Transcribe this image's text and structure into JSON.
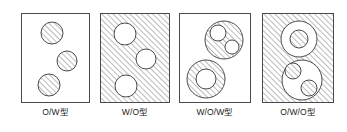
{
  "figure": {
    "title": "",
    "type": "emulsion-type-diagram",
    "colors": {
      "stroke": "#4a4a4a",
      "hatch": "#6b6b6b",
      "background": "#ffffff",
      "label": "#1a1a1a"
    },
    "hatch": {
      "angle_deg": 45,
      "direction": "lower-left-to-upper-right",
      "spacing_px": 4
    }
  },
  "panels": [
    {
      "id": "o-w",
      "label": "O/W型",
      "continuous_phase": "white",
      "box": {
        "x": 21,
        "y": 13,
        "width": 69,
        "height": 90
      },
      "droplets": [
        {
          "cx": 30,
          "cy": 19,
          "r": 11,
          "fill": "hatched",
          "inner": []
        },
        {
          "cx": 45,
          "cy": 47,
          "r": 10,
          "fill": "hatched",
          "inner": []
        },
        {
          "cx": 27,
          "cy": 71,
          "r": 11,
          "fill": "hatched",
          "inner": []
        }
      ]
    },
    {
      "id": "w-o",
      "label": "W/O型",
      "continuous_phase": "hatched",
      "box": {
        "x": 100,
        "y": 13,
        "width": 70,
        "height": 90
      },
      "droplets": [
        {
          "cx": 24,
          "cy": 20,
          "r": 11,
          "fill": "white",
          "inner": []
        },
        {
          "cx": 45,
          "cy": 45,
          "r": 10,
          "fill": "white",
          "inner": []
        },
        {
          "cx": 25,
          "cy": 72,
          "r": 11,
          "fill": "white",
          "inner": []
        }
      ]
    },
    {
      "id": "w-o-w",
      "label": "W/O/W型",
      "continuous_phase": "white",
      "box": {
        "x": 179,
        "y": 13,
        "width": 72,
        "height": 90
      },
      "droplets": [
        {
          "cx": 44,
          "cy": 26,
          "r": 19,
          "fill": "hatched",
          "inner": [
            {
              "cx": 38,
              "cy": 19,
              "r": 8,
              "fill": "white"
            },
            {
              "cx": 52,
              "cy": 33,
              "r": 7,
              "fill": "white"
            }
          ]
        },
        {
          "cx": 26,
          "cy": 65,
          "r": 19,
          "fill": "hatched",
          "inner": [
            {
              "cx": 26,
              "cy": 65,
              "r": 10,
              "fill": "white"
            }
          ]
        }
      ]
    },
    {
      "id": "o-w-o",
      "label": "O/W/O型",
      "continuous_phase": "hatched",
      "box": {
        "x": 262,
        "y": 13,
        "width": 72,
        "height": 90
      },
      "droplets": [
        {
          "cx": 36,
          "cy": 25,
          "r": 18,
          "fill": "white",
          "inner": [
            {
              "cx": 36,
              "cy": 25,
              "r": 9,
              "fill": "hatched"
            }
          ]
        },
        {
          "cx": 39,
          "cy": 66,
          "r": 20,
          "fill": "white",
          "inner": [
            {
              "cx": 30,
              "cy": 57,
              "r": 8,
              "fill": "hatched"
            },
            {
              "cx": 46,
              "cy": 74,
              "r": 8,
              "fill": "hatched"
            }
          ]
        }
      ]
    }
  ]
}
